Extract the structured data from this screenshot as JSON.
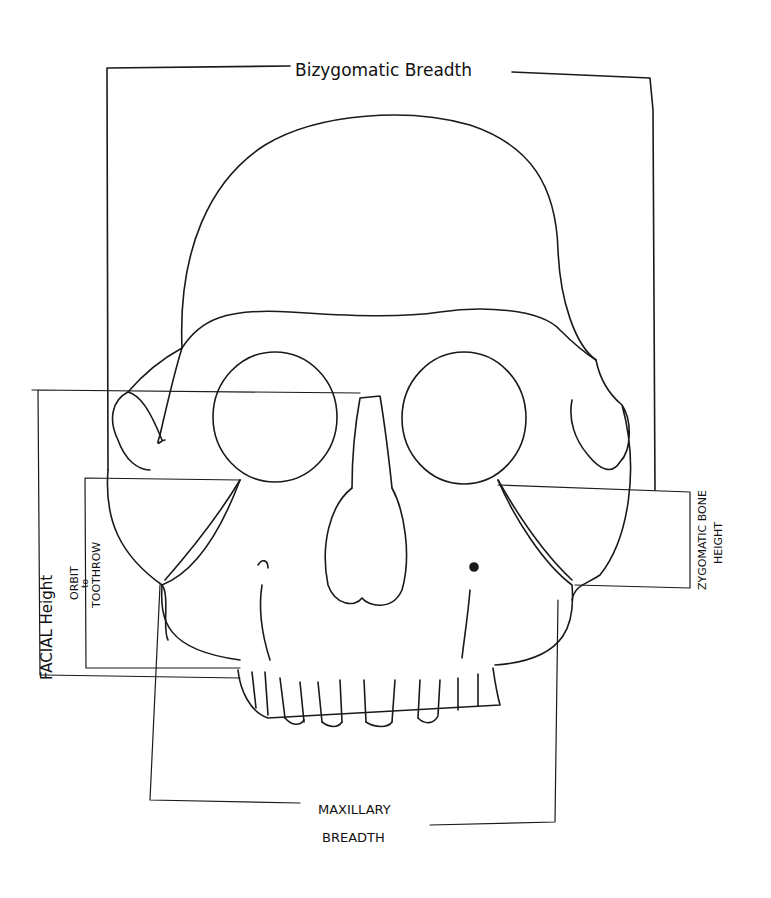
{
  "diagram": {
    "type": "annotated skull measurement sketch (frontal view)",
    "stroke_color": "#1a1a1a",
    "labels": {
      "bizygomatic": "Bizygomatic Breadth",
      "facial_height": "FACIAL Height",
      "orbit_line1": "ORBIT",
      "orbit_line2": "to",
      "orbit_line3": "TOOTHROW",
      "zygomatic_line1": "ZYGOMATIC BONE",
      "zygomatic_line2": "HEIGHT",
      "maxillary_line1": "MAXILLARY",
      "maxillary_line2": "BREADTH"
    }
  }
}
